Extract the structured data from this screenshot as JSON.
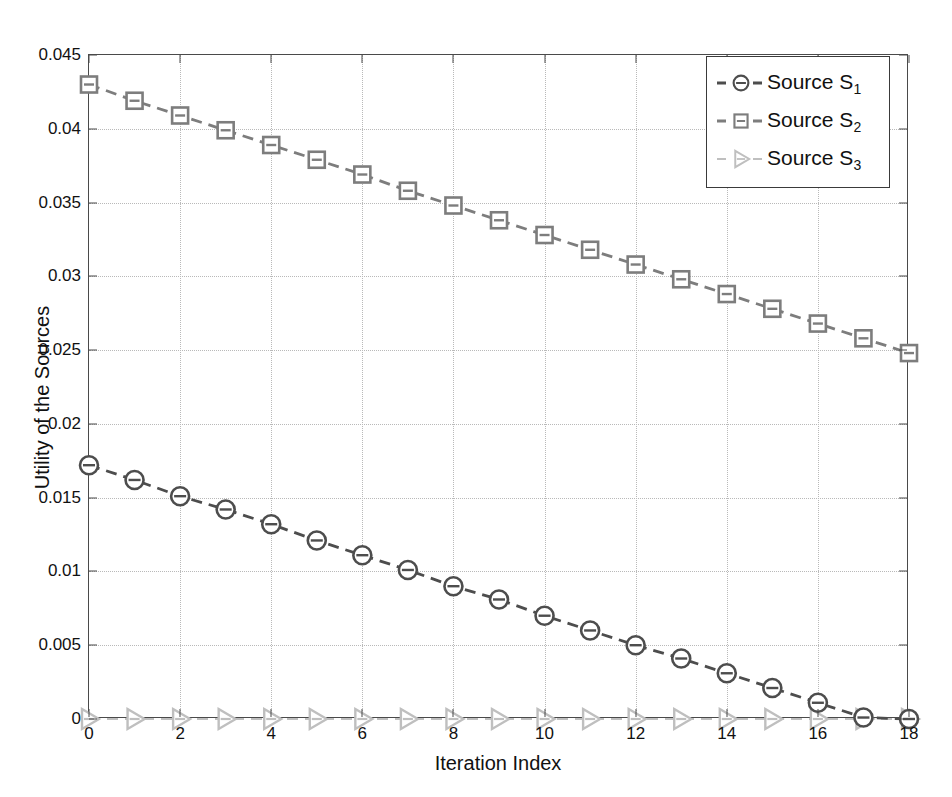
{
  "figure": {
    "faint_header": "",
    "bg_color": "#ffffff",
    "frame_color": "#4a4a4a",
    "grid_color": "#b9b9b9"
  },
  "axes": {
    "xlabel": "Iteration Index",
    "ylabel": "Utility of the Sources",
    "xticks": [
      "0",
      "2",
      "4",
      "6",
      "8",
      "10",
      "12",
      "14",
      "16",
      "18"
    ],
    "xtick_values": [
      0,
      2,
      4,
      6,
      8,
      10,
      12,
      14,
      16,
      18
    ],
    "yticks": [
      "0",
      "0.005",
      "0.01",
      "0.015",
      "0.02",
      "0.025",
      "0.03",
      "0.035",
      "0.04",
      "0.045"
    ],
    "ytick_values": [
      0,
      0.005,
      0.01,
      0.015,
      0.02,
      0.025,
      0.03,
      0.035,
      0.04,
      0.045
    ],
    "xlim": [
      0,
      18
    ],
    "ylim": [
      0,
      0.045
    ],
    "grid": true
  },
  "legend": {
    "position": "top-right",
    "entries": [
      {
        "label": "Source S",
        "sub": "1",
        "marker": "circle-marker",
        "color": "#4d4d4d"
      },
      {
        "label": "Source S",
        "sub": "2",
        "marker": "square-marker",
        "color": "#7d7d7d"
      },
      {
        "label": "Source S",
        "sub": "3",
        "marker": "right-triangle-marker",
        "color": "#bfbfbf"
      }
    ]
  },
  "chart_data": {
    "type": "line",
    "title": "",
    "xlabel": "Iteration Index",
    "ylabel": "Utility of the Sources",
    "xlim": [
      0,
      18
    ],
    "ylim": [
      0,
      0.045
    ],
    "grid": true,
    "legend_position": "top-right",
    "x": [
      0,
      1,
      2,
      3,
      4,
      5,
      6,
      7,
      8,
      9,
      10,
      11,
      12,
      13,
      14,
      15,
      16,
      17,
      18
    ],
    "series": [
      {
        "name": "Source S1",
        "marker": "circle",
        "linestyle": "dashed",
        "color": "#4d4d4d",
        "values": [
          0.0172,
          0.0162,
          0.0151,
          0.0142,
          0.0132,
          0.0121,
          0.0111,
          0.0101,
          0.009,
          0.0081,
          0.007,
          0.006,
          0.005,
          0.0041,
          0.0031,
          0.0021,
          0.0011,
          0.0001,
          0.0
        ]
      },
      {
        "name": "Source S2",
        "marker": "square",
        "linestyle": "dashed",
        "color": "#7d7d7d",
        "values": [
          0.043,
          0.0419,
          0.0409,
          0.0399,
          0.0389,
          0.0379,
          0.0369,
          0.0358,
          0.0348,
          0.0338,
          0.0328,
          0.0318,
          0.0308,
          0.0298,
          0.0288,
          0.0278,
          0.0268,
          0.0258,
          0.0248
        ]
      },
      {
        "name": "Source S3",
        "marker": "right-triangle",
        "linestyle": "dashed",
        "color": "#bfbfbf",
        "values": [
          0,
          0,
          0,
          0,
          0,
          0,
          0,
          0,
          0,
          0,
          0,
          0,
          0,
          0,
          0,
          0,
          0,
          0,
          0
        ]
      }
    ]
  }
}
